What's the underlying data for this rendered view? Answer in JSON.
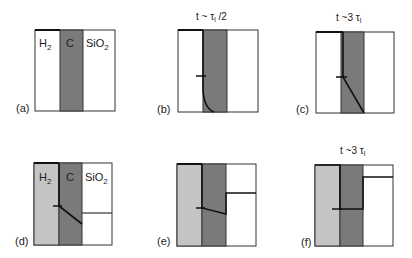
{
  "panels": [
    {
      "id": "a",
      "label": "(a)",
      "title": "",
      "box": {
        "x": 35,
        "y": 30,
        "w": 80,
        "h": 81
      },
      "left_fill": "#ffffff",
      "band": {
        "x1": 60,
        "x2": 83,
        "color": "#7a7a7a"
      },
      "region_labels": [
        "H2",
        "C",
        "SiO2"
      ]
    },
    {
      "id": "b",
      "label": "(b)",
      "title": "t ~ τ_l /2",
      "box": {
        "x": 178,
        "y": 30,
        "w": 80,
        "h": 82
      },
      "left_fill": "#ffffff",
      "band": {
        "x1": 203,
        "x2": 227,
        "color": "#7a7a7a"
      },
      "region_labels": []
    },
    {
      "id": "c",
      "label": "(c)",
      "title": "t ~3 τ_l",
      "box": {
        "x": 316,
        "y": 32,
        "w": 78,
        "h": 81
      },
      "left_fill": "#ffffff",
      "band": {
        "x1": 341,
        "x2": 364,
        "color": "#7a7a7a"
      },
      "region_labels": []
    },
    {
      "id": "d",
      "label": "(d)",
      "title": "",
      "box": {
        "x": 34,
        "y": 163,
        "w": 78,
        "h": 82
      },
      "left_fill": "#c4c4c4",
      "band": {
        "x1": 59,
        "x2": 82,
        "color": "#7a7a7a"
      },
      "region_labels": [
        "H2",
        "C",
        "SiO2"
      ]
    },
    {
      "id": "e",
      "label": "(e)",
      "title": "",
      "box": {
        "x": 177,
        "y": 164,
        "w": 79,
        "h": 82
      },
      "left_fill": "#c4c4c4",
      "band": {
        "x1": 202,
        "x2": 226,
        "color": "#7a7a7a"
      },
      "region_labels": []
    },
    {
      "id": "f",
      "label": "(f)",
      "title": "t ~3 τ_l",
      "box": {
        "x": 315,
        "y": 165,
        "w": 78,
        "h": 81
      },
      "left_fill": "#c4c4c4",
      "band": {
        "x1": 340,
        "x2": 363,
        "color": "#7a7a7a"
      },
      "region_labels": []
    }
  ],
  "text": {
    "a_label": "(a)",
    "b_label": "(b)",
    "c_label": "(c)",
    "d_label": "(d)",
    "e_label": "(e)",
    "f_label": "(f)",
    "h2": "H",
    "h2_sub": "2",
    "c": "C",
    "sio2": "SiO",
    "sio2_sub": "2",
    "title_b_main": "t ~ τ",
    "title_b_sub": "l",
    "title_b_tail": " /2",
    "title_c_main": "t ~3 τ",
    "title_c_sub": "l",
    "title_f_main": "t ~3 τ",
    "title_f_sub": "l"
  }
}
